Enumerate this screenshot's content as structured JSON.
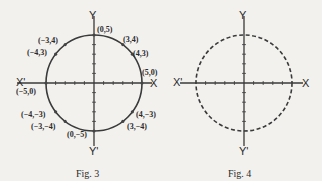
{
  "figures": [
    {
      "id": "fig3",
      "caption": "Fig. 3",
      "axes": {
        "x": "X",
        "x_neg": "X'",
        "y": "Y",
        "y_neg": "Y'"
      },
      "circle_style": "solid",
      "radius": 5,
      "points": [
        {
          "label": "(0,5)",
          "x": 0,
          "y": 5
        },
        {
          "label": "(3,4)",
          "x": 3,
          "y": 4
        },
        {
          "label": "(4,3)",
          "x": 4,
          "y": 3
        },
        {
          "label": "(5,0)",
          "x": 5,
          "y": 0
        },
        {
          "label": "(4,−3)",
          "x": 4,
          "y": -3
        },
        {
          "label": "(3,−4)",
          "x": 3,
          "y": -4
        },
        {
          "label": "(0,−5)",
          "x": 0,
          "y": -5
        },
        {
          "label": "(−3,−4)",
          "x": -3,
          "y": -4
        },
        {
          "label": "(−4,−3)",
          "x": -4,
          "y": -3
        },
        {
          "label": "(−5,0)",
          "x": -5,
          "y": 0
        },
        {
          "label": "(−4,3)",
          "x": -4,
          "y": 3
        },
        {
          "label": "(−3,4)",
          "x": -3,
          "y": 4
        }
      ]
    },
    {
      "id": "fig4",
      "caption": "Fig. 4",
      "axes": {
        "x": "X",
        "x_neg": "X'",
        "y": "Y",
        "y_neg": "Y'"
      },
      "circle_style": "dashed",
      "radius": 5,
      "points": []
    }
  ]
}
